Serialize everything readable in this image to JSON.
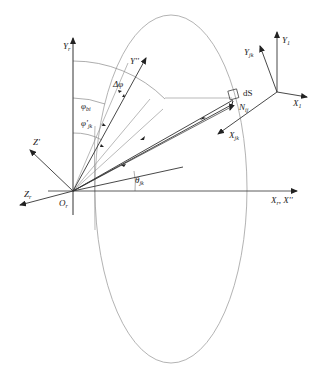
{
  "diagram": {
    "type": "coordinate-geometry",
    "colors": {
      "line": "#333333",
      "thin_line": "#8a8a8a",
      "ellipse": "#9a9a9a",
      "background": "#ffffff"
    },
    "labels": {
      "y_r": "Y",
      "y_r_sub": "r",
      "y_dprime": "Y''",
      "delta_phi": "Δφ",
      "phi_bi": "φ",
      "phi_bi_sub": "bi",
      "phi_jk": "φ'",
      "phi_jk_sub": "jk",
      "z_prime": "Z'",
      "z_r": "Z",
      "z_r_sub": "r",
      "o_r": "O",
      "o_r_sub": "r",
      "theta_jk": "θ",
      "theta_jk_sub": "jk",
      "x_axis": "X",
      "x_axis_sub": "r",
      "x_axis_extra": ", X''",
      "ds": "dS",
      "n_ij": "N",
      "n_ij_sub": "ij",
      "x_jk": "X",
      "x_jk_sub": "jk",
      "y_jk": "Y",
      "y_jk_sub": "jk",
      "y_1": "Y",
      "y_1_sub": "1",
      "x_1": "X",
      "x_1_sub": "1"
    }
  }
}
